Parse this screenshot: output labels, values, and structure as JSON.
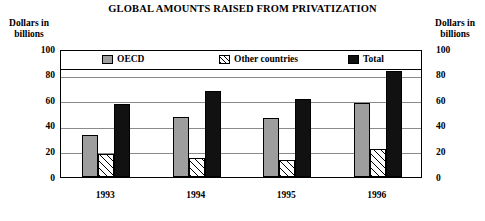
{
  "chart_data": {
    "type": "bar",
    "title": "GLOBAL AMOUNTS RAISED FROM PRIVATIZATION",
    "xlabel": "",
    "ylabel": "Dollars in billions",
    "ylabel_left": "Dollars in\nbillions",
    "ylabel_right": "Dollars in\nbillions",
    "categories": [
      "1993",
      "1994",
      "1995",
      "1996"
    ],
    "series": [
      {
        "name": "OECD",
        "values": [
          33,
          47,
          46,
          58
        ]
      },
      {
        "name": "Other countries",
        "values": [
          18,
          15,
          13,
          22
        ]
      },
      {
        "name": "Total",
        "values": [
          57,
          67,
          61,
          83
        ]
      }
    ],
    "ylim": [
      0,
      100
    ],
    "yticks": [
      0,
      20,
      40,
      60,
      80,
      100
    ],
    "ytick_labels": [
      "0",
      "20",
      "40",
      "60",
      "80",
      "100"
    ],
    "grid": true,
    "grid_axis": "y",
    "legend_position": "top-inside",
    "dual_axis": true
  },
  "axis_captions": {
    "left_line1": "Dollars in",
    "left_line2": "billions",
    "right_line1": "Dollars in",
    "right_line2": "billions"
  },
  "legend": {
    "items": [
      {
        "label": "OECD",
        "swatch": "gray-filled-swatch"
      },
      {
        "label": "Other countries",
        "swatch": "diagonal-hatch-swatch"
      },
      {
        "label": "Total",
        "swatch": "black-filled-swatch"
      }
    ]
  },
  "colors": {
    "oecd": "#9e9e9e",
    "other_countries": "#ffffff",
    "total": "#111111",
    "outline": "#000000",
    "gridline": "#8a8a8a",
    "background": "#ffffff"
  }
}
